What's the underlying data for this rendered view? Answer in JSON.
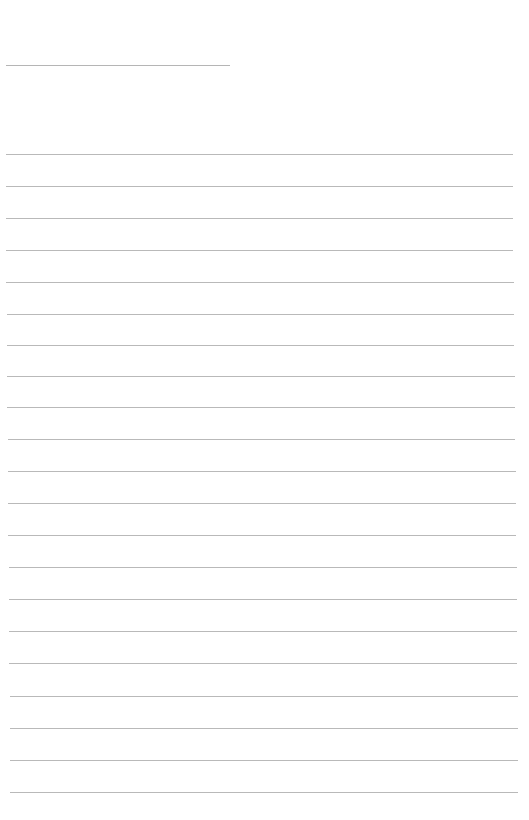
{
  "document": {
    "type": "lined-paper",
    "background_color": "#ffffff",
    "line_color": "#b9b9b9",
    "title_line": {
      "y": 65,
      "x1": 6,
      "x2": 230
    },
    "ruled_lines": [
      {
        "y": 154,
        "x1": 6,
        "x2": 513
      },
      {
        "y": 186,
        "x1": 6,
        "x2": 513
      },
      {
        "y": 218,
        "x1": 6,
        "x2": 513
      },
      {
        "y": 250,
        "x1": 6,
        "x2": 513
      },
      {
        "y": 282,
        "x1": 6,
        "x2": 514
      },
      {
        "y": 314,
        "x1": 7,
        "x2": 514
      },
      {
        "y": 345,
        "x1": 7,
        "x2": 514
      },
      {
        "y": 376,
        "x1": 7,
        "x2": 515
      },
      {
        "y": 407,
        "x1": 7,
        "x2": 515
      },
      {
        "y": 439,
        "x1": 8,
        "x2": 515
      },
      {
        "y": 471,
        "x1": 8,
        "x2": 516
      },
      {
        "y": 503,
        "x1": 8,
        "x2": 516
      },
      {
        "y": 535,
        "x1": 8,
        "x2": 516
      },
      {
        "y": 567,
        "x1": 9,
        "x2": 517
      },
      {
        "y": 599,
        "x1": 9,
        "x2": 517
      },
      {
        "y": 631,
        "x1": 9,
        "x2": 517
      },
      {
        "y": 663,
        "x1": 9,
        "x2": 517
      },
      {
        "y": 696,
        "x1": 10,
        "x2": 518
      },
      {
        "y": 728,
        "x1": 10,
        "x2": 518
      },
      {
        "y": 760,
        "x1": 10,
        "x2": 518
      },
      {
        "y": 792,
        "x1": 10,
        "x2": 518
      }
    ]
  }
}
